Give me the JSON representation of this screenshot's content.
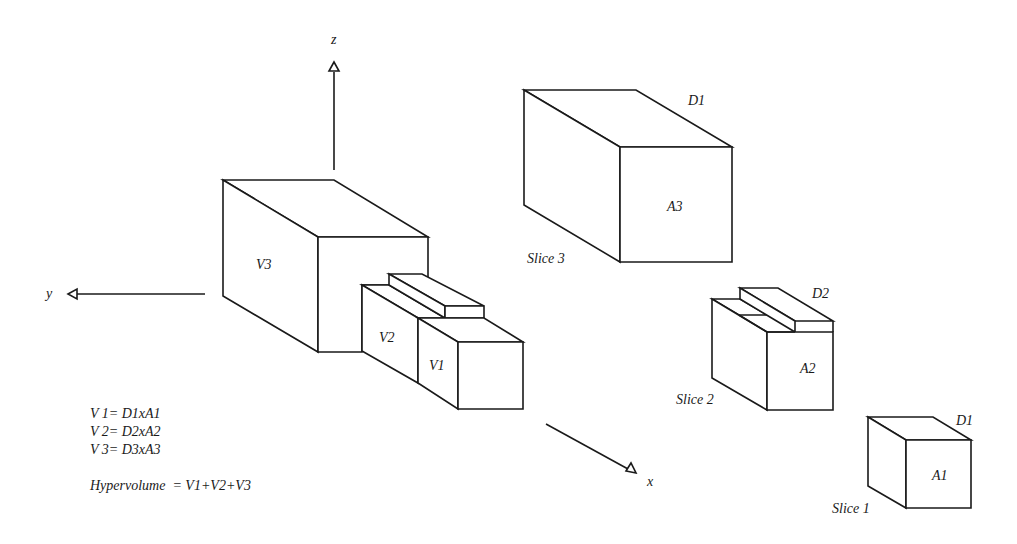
{
  "axes": {
    "x": "x",
    "y": "y",
    "z": "z"
  },
  "main_figure": {
    "volumes": [
      "V1",
      "V2",
      "V3"
    ]
  },
  "slices": [
    {
      "name": "Slice 3",
      "area": "A3",
      "depth": "D1"
    },
    {
      "name": "Slice 2",
      "area": "A2",
      "depth": "D2"
    },
    {
      "name": "Slice 1",
      "area": "A1",
      "depth": "D1"
    }
  ],
  "formulas": [
    "V 1= D1xA1",
    "V 2= D2xA2",
    "V 3= D3xA3"
  ],
  "hypervolume": "Hypervolume  = V1+V2+V3",
  "colors": {
    "stroke": "#1a1a1a",
    "background": "#ffffff"
  }
}
